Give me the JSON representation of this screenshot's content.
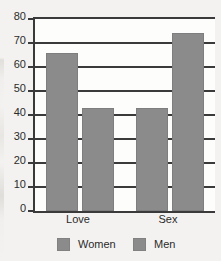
{
  "chart_data": {
    "type": "bar",
    "title": "",
    "subtitle": "",
    "xlabel": "",
    "ylabel": "",
    "categories": [
      "Love",
      "Sex"
    ],
    "series": [
      {
        "name": "Women",
        "values": [
          66,
          43
        ],
        "color": "#8b8b8b"
      },
      {
        "name": "Men",
        "values": [
          43,
          74
        ],
        "color": "#8b8b8b"
      }
    ],
    "ylim": [
      0,
      80
    ],
    "ytick_interval": 10,
    "yticks": [
      80,
      70,
      60,
      50,
      40,
      30,
      20,
      10,
      0
    ],
    "ytick_labels": [
      "80",
      "70",
      "60",
      "50",
      "40",
      "30",
      "20",
      "10",
      "0"
    ],
    "xtick_labels": [
      "Love",
      "Sex"
    ],
    "grid": "horizontal",
    "legend_position": "bottom",
    "legend_entries": [
      "Women",
      "Men"
    ],
    "annotations": []
  },
  "style": {
    "bar_color": "#8b8b8b",
    "axis_color": "#3a3a3a",
    "text_color": "#2b2b2b",
    "plot_background": "#fdfdfc",
    "figure_background": "#f3f2f0"
  }
}
